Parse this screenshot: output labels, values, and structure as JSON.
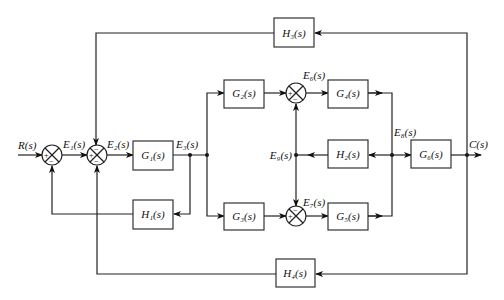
{
  "blocks": {
    "G1": "G₁(s)",
    "G2": "G₂(s)",
    "G3": "G₃(s)",
    "G4": "G₄(s)",
    "G5": "G₅(s)",
    "G6": "G₆(s)",
    "H1": "H₁(s)",
    "H2": "H₂(s)",
    "H3": "H₃(s)",
    "H4": "H₄(s)"
  },
  "signals": {
    "input": "R(s)",
    "output": "C(s)",
    "E1": "E₁(s)",
    "E2": "E₂(s)",
    "E3": "E₃(s)",
    "E6": "E₆(s)",
    "E7": "E₇(s)",
    "E8": "E₈(s)",
    "E9": "E₉(s)"
  },
  "summing_junctions": {
    "S1": {
      "left": "+",
      "bottom": "−"
    },
    "S2": {
      "left": "+",
      "top": "−",
      "bottom": "−"
    },
    "S6": {
      "left": "+",
      "bottom": "−"
    },
    "S7": {
      "left": "+",
      "top": "−"
    }
  },
  "signs": {
    "plus": "+",
    "minus": "−"
  }
}
